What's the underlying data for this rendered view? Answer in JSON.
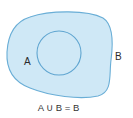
{
  "diagram": {
    "type": "venn",
    "sets": [
      {
        "name": "A",
        "label": "A",
        "role": "inner circle (subset)"
      },
      {
        "name": "B",
        "label": "B",
        "role": "outer region (superset)"
      }
    ],
    "equation": "A ∪ B = B",
    "colors": {
      "fill": "#cfe8f6",
      "stroke": "#6aaed6",
      "text": "#2a2a2a"
    }
  }
}
